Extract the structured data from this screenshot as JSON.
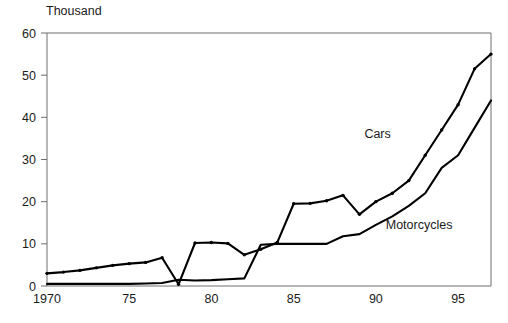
{
  "chart_data": {
    "type": "line",
    "title": "",
    "ylabel": "Thousand",
    "xlabel": "",
    "ylim": [
      0,
      60
    ],
    "xlim": [
      1970,
      1997
    ],
    "grid": false,
    "legend_position": "inline-annotation",
    "yticks": [
      0,
      10,
      20,
      30,
      40,
      50,
      60
    ],
    "ytick_labels": [
      "0",
      "10",
      "20",
      "30",
      "40",
      "50",
      "60"
    ],
    "xticks": [
      1970,
      1975,
      1980,
      1985,
      1990,
      1995
    ],
    "xtick_labels": [
      "1970",
      "75",
      "80",
      "85",
      "90",
      "95"
    ],
    "x": [
      1970,
      1971,
      1972,
      1973,
      1974,
      1975,
      1976,
      1977,
      1978,
      1979,
      1980,
      1981,
      1982,
      1983,
      1984,
      1985,
      1986,
      1987,
      1988,
      1989,
      1990,
      1991,
      1992,
      1993,
      1994,
      1995,
      1996,
      1997
    ],
    "series": [
      {
        "name": "Cars",
        "markers": true,
        "values": [
          3.0,
          3.3,
          3.7,
          4.3,
          4.9,
          5.3,
          5.6,
          6.7,
          0.4,
          10.2,
          10.3,
          10.1,
          7.4,
          8.7,
          10.3,
          19.5,
          19.6,
          20.2,
          21.5,
          17.0,
          20.0,
          22.0,
          25.0,
          31.0,
          37.0,
          43.0,
          51.5,
          55.0
        ]
      },
      {
        "name": "Motorcycles",
        "markers": false,
        "values": [
          0.5,
          0.5,
          0.5,
          0.5,
          0.5,
          0.5,
          0.6,
          0.7,
          1.5,
          1.3,
          1.4,
          1.6,
          1.8,
          9.8,
          10.0,
          10.0,
          10.0,
          10.0,
          11.8,
          12.3,
          14.5,
          16.5,
          19.0,
          22.0,
          28.0,
          31.0,
          37.5,
          44.0
        ]
      }
    ],
    "annotations": [
      {
        "text": "Cars",
        "x": 1989.3,
        "y": 35.0
      },
      {
        "text": "Motorcycles",
        "x": 1990.6,
        "y": 13.5
      }
    ]
  },
  "colors": {
    "line": "#000000",
    "frame": "#6e6e6e",
    "text": "#1a1a1a",
    "background": "#ffffff"
  }
}
